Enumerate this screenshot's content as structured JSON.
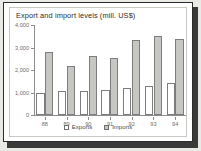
{
  "chart_data": {
    "type": "bar",
    "title": "Export and import levels (mill. US$)",
    "xlabel": "",
    "ylabel": "",
    "categories": [
      "88",
      "89",
      "90",
      "91",
      "92",
      "93",
      "94"
    ],
    "series": [
      {
        "name": "Exports",
        "values": [
          1000,
          1080,
          1050,
          1130,
          1220,
          1270,
          1430
        ],
        "color": "#ffffff"
      },
      {
        "name": "Imports",
        "values": [
          2780,
          2180,
          2620,
          2530,
          3320,
          3520,
          3370
        ],
        "color": "#c6c6c2"
      }
    ],
    "ylim": [
      0,
      4000
    ],
    "yticks": [
      0,
      1000,
      2000,
      3000,
      4000
    ],
    "ytick_labels": [
      "0",
      "1,000",
      "2,000",
      "3,000",
      "4,000"
    ],
    "grid": false,
    "legend_position": "bottom-center"
  },
  "figure": {
    "border_color": "#2b2b2b",
    "plot_background": "#ffffff",
    "axis_color": "#8d8d8d"
  }
}
